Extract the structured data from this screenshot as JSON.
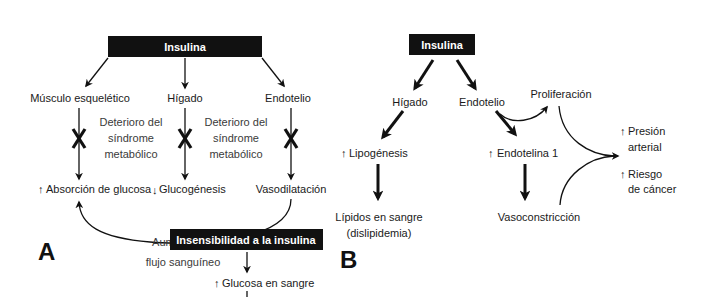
{
  "colors": {
    "box_fill": "#111111",
    "box_text": "#ffffff",
    "line": "#111111",
    "text": "#1a1a1a",
    "background": "#ffffff"
  },
  "panel_a": {
    "letter": "A",
    "title_box": "Insulina",
    "targets": [
      {
        "label": "Músculo esquelético",
        "outcome": "Absorción de glucosa",
        "outcome_direction": "up-arrow-icon"
      },
      {
        "label": "Hígado",
        "outcome": "Glucogénesis",
        "outcome_direction": "down-arrow-icon"
      },
      {
        "label": "Endotelio",
        "outcome": "Vasodilatación",
        "outcome_direction": ""
      }
    ],
    "impairment_notes": [
      {
        "line1": "Deterioro del",
        "line2": "síndrome",
        "line3": "metabólico"
      },
      {
        "line1": "Deterioro del",
        "line2": "síndrome",
        "line3": "metabólico"
      }
    ],
    "feedback": {
      "line1": "Aumento del",
      "line2": "flujo sanguíneo"
    }
  },
  "panel_b": {
    "letter": "B",
    "title_box": "Insulina",
    "liver": {
      "label": "Hígado",
      "effect": "Lipogénesis",
      "result_line1": "Lípidos en sangre",
      "result_line2": "(dislipidemia)"
    },
    "endothelium": {
      "label": "Endotelio",
      "proliferation": "Proliferación",
      "effect": "Endotelina 1",
      "result": "Vasoconstricción"
    },
    "outcomes": [
      {
        "line1": "Presión",
        "line2": "arterial"
      },
      {
        "line1": "Riesgo",
        "line2": "de cáncer"
      }
    ]
  },
  "panel_c": {
    "title_box": "Insensibilidad a la insulina",
    "effect": "Glucosa en sangre"
  },
  "glyphs": {
    "up": "↑",
    "down": "↓"
  }
}
